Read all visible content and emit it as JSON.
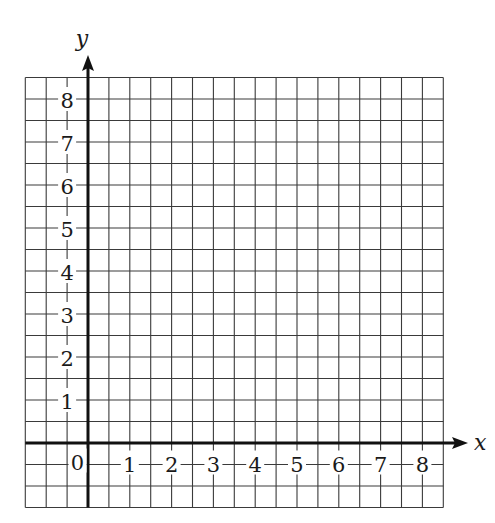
{
  "chart_data": {
    "type": "scatter",
    "title": "",
    "xlabel": "x",
    "ylabel": "y",
    "x_ticks": [
      "1",
      "2",
      "3",
      "4",
      "5",
      "6",
      "7",
      "8"
    ],
    "y_ticks": [
      "1",
      "2",
      "3",
      "4",
      "5",
      "6",
      "7",
      "8"
    ],
    "origin_label": "0",
    "xlim": [
      -1.5,
      8.5
    ],
    "ylim": [
      -1.5,
      8.5
    ],
    "grid": true,
    "grid_step": 0.5,
    "series": []
  },
  "colors": {
    "grid": "#3a3a3a",
    "axis": "#111111",
    "background": "#ffffff"
  }
}
